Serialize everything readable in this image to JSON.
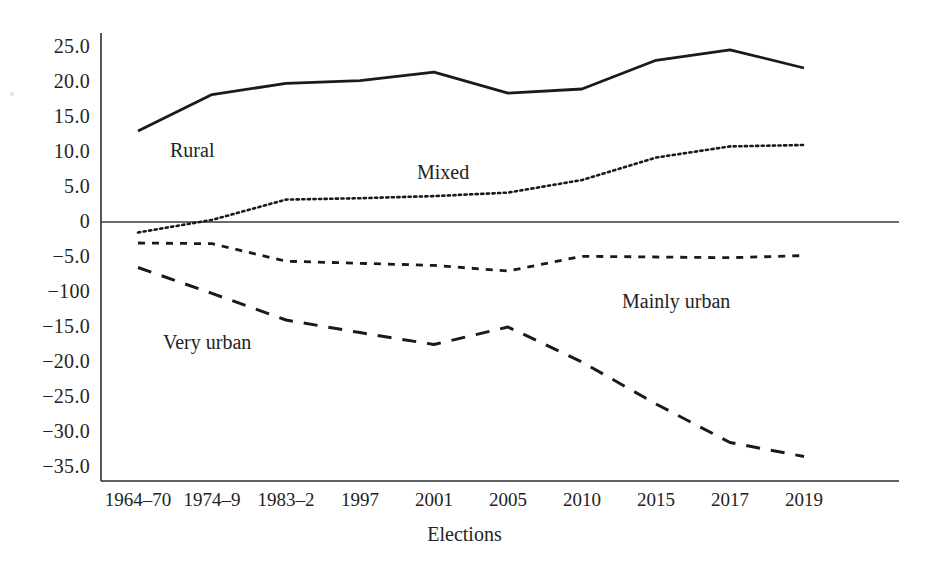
{
  "chart_data": {
    "type": "line",
    "title": "",
    "xlabel": "Elections",
    "ylabel": "",
    "categories": [
      "1964–70",
      "1974–9",
      "1983–2",
      "1997",
      "2001",
      "2005",
      "2010",
      "2015",
      "2017",
      "2019"
    ],
    "ytick_labels": [
      "25.0",
      "20.0",
      "15.0",
      "10.0",
      "5.0",
      "0",
      "−5.0",
      "−100",
      "−15.0",
      "−20.0",
      "−25.0",
      "−30.0",
      "−35.0"
    ],
    "ytick_values": [
      25,
      20,
      15,
      10,
      5,
      0,
      -5,
      -10,
      -15,
      -20,
      -25,
      -30,
      -35
    ],
    "ylim": [
      -37,
      27
    ],
    "grid": false,
    "legend_position": "inline-annotations",
    "zero_line": true,
    "series": [
      {
        "name": "Rural",
        "style": "solid",
        "values": [
          13.0,
          18.2,
          19.8,
          20.2,
          21.4,
          18.4,
          19.0,
          23.1,
          24.6,
          22.0
        ],
        "label": "Rural",
        "label_x": 170,
        "label_y": 139
      },
      {
        "name": "Mixed",
        "style": "dotted",
        "values": [
          -1.5,
          0.3,
          3.2,
          3.4,
          3.7,
          4.2,
          6.0,
          9.2,
          10.8,
          11.0
        ],
        "label": "Mixed",
        "label_x": 417,
        "label_y": 161
      },
      {
        "name": "Mainly urban",
        "style": "dashed-short",
        "values": [
          -3.0,
          -3.1,
          -5.6,
          -5.9,
          -6.2,
          -7.0,
          -4.9,
          -5.0,
          -5.1,
          -4.8
        ],
        "label": "Mainly urban",
        "label_x": 622,
        "label_y": 290
      },
      {
        "name": "Very urban",
        "style": "dashed-long",
        "values": [
          -6.5,
          -10.2,
          -14.0,
          -15.8,
          -17.5,
          -15.0,
          -20.0,
          -26.0,
          -31.5,
          -33.5
        ],
        "label": "Very urban",
        "label_x": 163,
        "label_y": 331
      }
    ]
  },
  "colors": {
    "ink": "#1a1a1a",
    "axis": "#2b2b2b",
    "background": "#ffffff"
  }
}
